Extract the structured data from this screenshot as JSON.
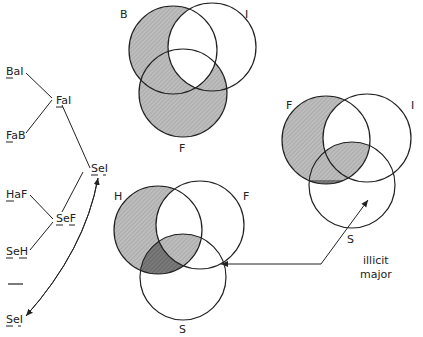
{
  "diagram": {
    "type": "syllogism-venn-diagrams",
    "colors": {
      "stroke": "#222222",
      "light_shade": "#b8b8b8",
      "dark_shade": "#707070",
      "background": "#ffffff"
    },
    "derivation_tree": {
      "premises_group_1": [
        "BaI",
        "FaB"
      ],
      "conclusion_1": "FaI",
      "premises_group_2": [
        "HaF",
        "SeH"
      ],
      "conclusion_2": "SeF",
      "combined_conclusion": "SeI",
      "separator": "—",
      "final": "SeI",
      "nodes": [
        {
          "id": "bai",
          "text": "BaI",
          "underline": [
            "B"
          ]
        },
        {
          "id": "fab",
          "text": "FaB",
          "underline": [
            "F"
          ]
        },
        {
          "id": "fai",
          "text": "FaI",
          "underline": [
            "F"
          ]
        },
        {
          "id": "sei_mid",
          "text": "SeI",
          "underline": [
            "S",
            "I"
          ]
        },
        {
          "id": "haf",
          "text": "HaF",
          "underline": [
            "H"
          ]
        },
        {
          "id": "sef",
          "text": "SeF",
          "underline": [
            "S",
            "F"
          ]
        },
        {
          "id": "seh",
          "text": "SeH",
          "underline": [
            "S",
            "H"
          ]
        },
        {
          "id": "sei_final",
          "text": "SeI",
          "underline": [
            "S",
            "I"
          ]
        }
      ]
    },
    "venn_top": {
      "labels": {
        "c1": "B",
        "c2": "I",
        "c3": "F"
      }
    },
    "venn_bottom": {
      "labels": {
        "c1": "H",
        "c2": "F",
        "c3": "S"
      }
    },
    "venn_right": {
      "labels": {
        "c1": "F",
        "c2": "I",
        "c3": "S"
      }
    },
    "annotation": {
      "line1": "illicit",
      "line2": "major"
    }
  }
}
